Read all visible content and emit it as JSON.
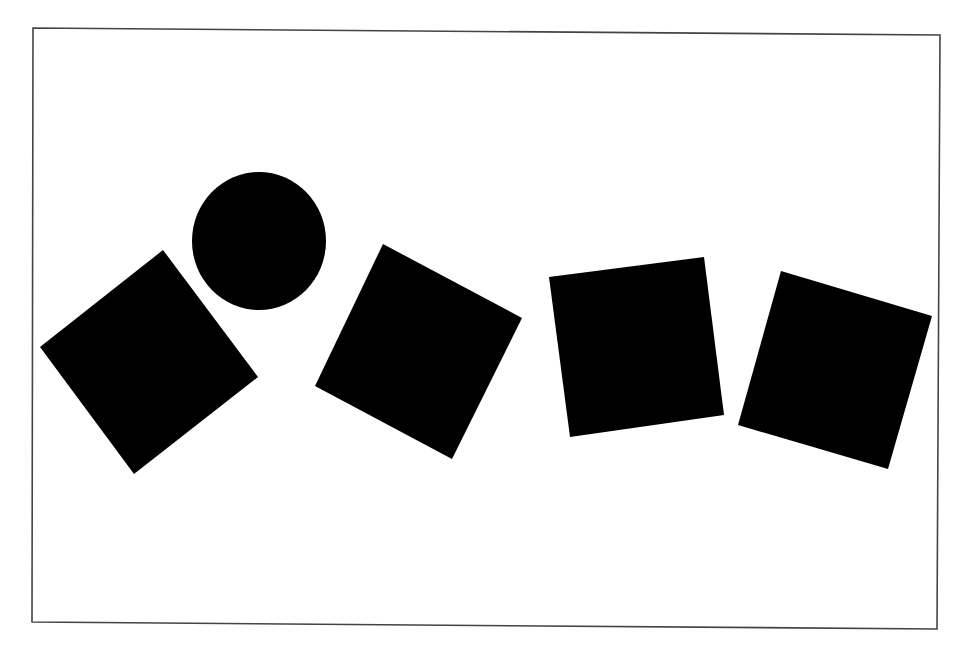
{
  "canvas": {
    "width": 973,
    "height": 661,
    "background": "#ffffff"
  },
  "frame": {
    "stroke": "#444444",
    "stroke_width": 1.6,
    "points": [
      [
        33,
        28
      ],
      [
        940,
        35
      ],
      [
        937,
        629
      ],
      [
        32,
        622
      ]
    ]
  },
  "shapes": [
    {
      "id": "square-1",
      "type": "polygon",
      "fill": "#000000",
      "points": [
        [
          163,
          250
        ],
        [
          258,
          377
        ],
        [
          134,
          474
        ],
        [
          40,
          347
        ]
      ]
    },
    {
      "id": "circle-1",
      "type": "ellipse",
      "fill": "#000000",
      "cx": 259,
      "cy": 241,
      "rx": 67,
      "ry": 69
    },
    {
      "id": "square-2",
      "type": "polygon",
      "fill": "#000000",
      "points": [
        [
          383,
          244
        ],
        [
          522,
          318
        ],
        [
          452,
          459
        ],
        [
          315,
          386
        ]
      ]
    },
    {
      "id": "square-3",
      "type": "polygon",
      "fill": "#000000",
      "points": [
        [
          549,
          277
        ],
        [
          704,
          257
        ],
        [
          724,
          415
        ],
        [
          570,
          437
        ]
      ]
    },
    {
      "id": "square-4",
      "type": "polygon",
      "fill": "#000000",
      "points": [
        [
          781,
          271
        ],
        [
          932,
          316
        ],
        [
          888,
          469
        ],
        [
          738,
          425
        ]
      ]
    }
  ]
}
